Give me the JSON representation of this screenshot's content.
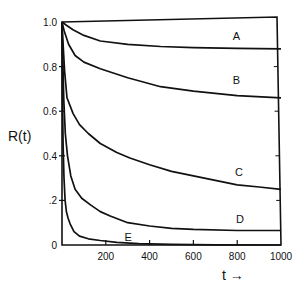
{
  "chart_data": {
    "type": "line",
    "title": "",
    "xlabel": "t →",
    "ylabel": "R(t)",
    "xlim": [
      0,
      1000
    ],
    "ylim": [
      0,
      1.0
    ],
    "grid": false,
    "legend": "inline curve labels near right end",
    "x_ticks": [
      200,
      400,
      600,
      800,
      1000
    ],
    "x_tick_labels": [
      "200",
      "400",
      "600",
      "800",
      "1000"
    ],
    "y_ticks": [
      0,
      0.2,
      0.4,
      0.6,
      0.8,
      1.0
    ],
    "y_tick_labels": [
      "0",
      ".2",
      "0.4",
      "0.6",
      "0.8",
      "1.0"
    ],
    "series": [
      {
        "name": "A",
        "label_at": [
          780,
          0.92
        ],
        "x": [
          0,
          20,
          50,
          100,
          175,
          300,
          450,
          600,
          800,
          1000
        ],
        "y": [
          1.0,
          0.985,
          0.965,
          0.94,
          0.915,
          0.9,
          0.89,
          0.885,
          0.882,
          0.88
        ]
      },
      {
        "name": "B",
        "label_at": [
          780,
          0.72
        ],
        "x": [
          0,
          10,
          30,
          60,
          100,
          175,
          300,
          450,
          600,
          800,
          1000
        ],
        "y": [
          1.0,
          0.96,
          0.9,
          0.85,
          0.82,
          0.79,
          0.75,
          0.71,
          0.69,
          0.67,
          0.66
        ]
      },
      {
        "name": "C",
        "label_at": [
          790,
          0.31
        ],
        "x": [
          0,
          5,
          12,
          23,
          50,
          80,
          120,
          175,
          250,
          310,
          400,
          500,
          600,
          700,
          800,
          900,
          1000
        ],
        "y": [
          1.0,
          0.9,
          0.78,
          0.66,
          0.59,
          0.54,
          0.5,
          0.455,
          0.415,
          0.39,
          0.36,
          0.33,
          0.31,
          0.29,
          0.27,
          0.26,
          0.25
        ]
      },
      {
        "name": "D",
        "label_at": [
          795,
          0.1
        ],
        "x": [
          0,
          3,
          8,
          15,
          25,
          40,
          60,
          90,
          130,
          175,
          220,
          300,
          400,
          500,
          600,
          800,
          1000
        ],
        "y": [
          1.0,
          0.85,
          0.65,
          0.5,
          0.4,
          0.31,
          0.25,
          0.21,
          0.18,
          0.15,
          0.13,
          0.1,
          0.085,
          0.075,
          0.07,
          0.065,
          0.065
        ]
      },
      {
        "name": "E",
        "label_at": [
          285,
          0.02
        ],
        "x": [
          0,
          2,
          5,
          9,
          14,
          20,
          28,
          37,
          55,
          80,
          120,
          175,
          250,
          350,
          500,
          700,
          1000
        ],
        "y": [
          1.0,
          0.7,
          0.45,
          0.3,
          0.2,
          0.15,
          0.12,
          0.095,
          0.06,
          0.04,
          0.028,
          0.02,
          0.012,
          0.006,
          0.003,
          0.001,
          0.0
        ]
      }
    ]
  }
}
